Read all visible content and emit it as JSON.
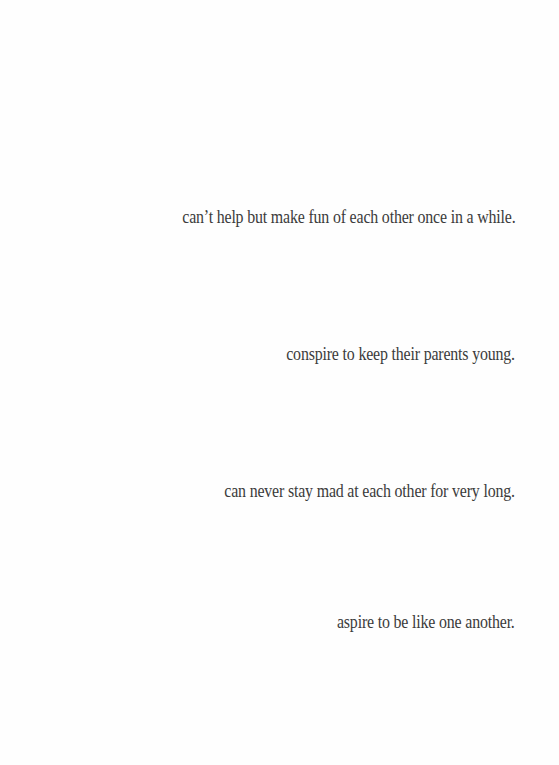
{
  "page": {
    "background_color": "#ffffff",
    "text_color": "#3b3b3b",
    "alignment": "right",
    "lines": [
      {
        "text": "can’t help but make fun of each other once in a while."
      },
      {
        "text": "conspire to keep their parents young."
      },
      {
        "text": "can never stay mad at each other for very long."
      },
      {
        "text": "aspire to be like one another."
      }
    ]
  }
}
